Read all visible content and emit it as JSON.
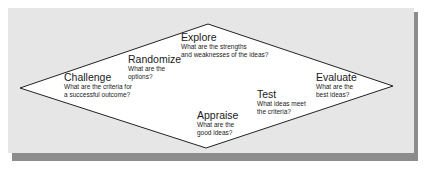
{
  "diagram": {
    "type": "diamond-process",
    "colors": {
      "panel": "#e6e6e6",
      "shadow": "#8c8c8c",
      "diamond_fill": "#ffffff",
      "stroke": "#222222"
    },
    "stages": [
      {
        "id": "challenge",
        "title": "Challenge",
        "question_line1": "What are the criteria for",
        "question_line2": "a successful outcome?"
      },
      {
        "id": "randomize",
        "title": "Randomize",
        "question_line1": "What are the",
        "question_line2": "options?"
      },
      {
        "id": "explore",
        "title": "Explore",
        "question_line1": "What are the strengths",
        "question_line2": "and weaknesses of the ideas?"
      },
      {
        "id": "appraise",
        "title": "Appraise",
        "question_line1": "What are the",
        "question_line2": "good ideas?"
      },
      {
        "id": "test",
        "title": "Test",
        "question_line1": "What ideas meet",
        "question_line2": "the criteria?"
      },
      {
        "id": "evaluate",
        "title": "Evaluate",
        "question_line1": "What are the",
        "question_line2": "best ideas?"
      }
    ]
  }
}
